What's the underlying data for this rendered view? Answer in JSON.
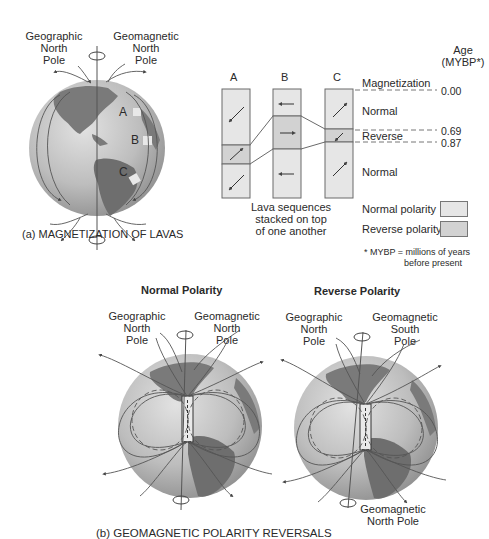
{
  "panel_a": {
    "caption": "(a) MAGNETIZATION OF LAVAS",
    "geographic_pole_label": [
      "Geographic",
      "North",
      "Pole"
    ],
    "geomagnetic_pole_label": [
      "Geomagnetic",
      "North",
      "Pole"
    ],
    "sites": [
      "A",
      "B",
      "C"
    ]
  },
  "lava_diagram": {
    "columns": [
      "A",
      "B",
      "C"
    ],
    "stack_caption": [
      "Lava sequences",
      "stacked on top",
      "of one another"
    ],
    "magnetization_header": "Magnetization",
    "age_header": [
      "Age",
      "(MYBP*)"
    ],
    "intervals": [
      {
        "label": "Normal",
        "polarity": "normal"
      },
      {
        "label": "Reverse",
        "polarity": "reverse"
      },
      {
        "label": "Normal",
        "polarity": "normal"
      }
    ],
    "ages": [
      "0.00",
      "0.69",
      "0.87"
    ],
    "legend": {
      "normal": "Normal polarity",
      "reverse": "Reverse polarity"
    },
    "footnote": [
      "* MYBP =  millions of years",
      "before present"
    ],
    "colors": {
      "normal": "#e6e6e6",
      "reverse": "#d2d2d2",
      "border": "#6a6a6a"
    }
  },
  "panel_b": {
    "caption": "(b) GEOMAGNETIC POLARITY REVERSALS",
    "normal": {
      "title": "Normal Polarity",
      "geographic_label": [
        "Geographic",
        "North",
        "Pole"
      ],
      "geomagnetic_label": [
        "Geomagnetic",
        "North",
        "Pole"
      ]
    },
    "reverse": {
      "title": "Reverse Polarity",
      "geographic_label": [
        "Geographic",
        "North",
        "Pole"
      ],
      "geomagnetic_top_label": [
        "Geomagnetic",
        "South",
        "Pole"
      ],
      "geomagnetic_bottom_label": [
        "Geomagnetic",
        "North Pole"
      ]
    }
  },
  "colors": {
    "ocean": "#b9b9b9",
    "land": "#7d7d7d",
    "lines": "#444444"
  }
}
